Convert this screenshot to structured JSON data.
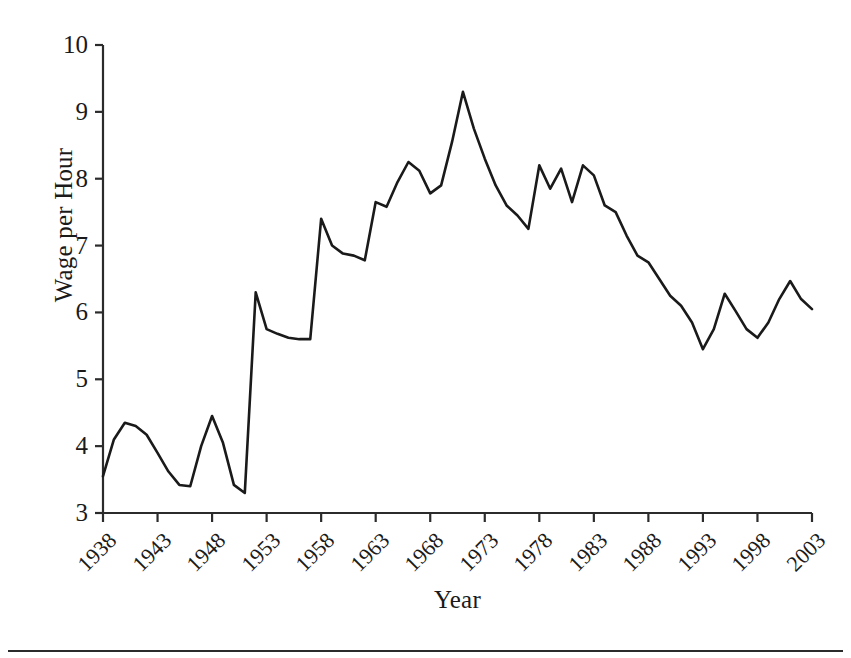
{
  "chart_data": {
    "type": "line",
    "title": "",
    "xlabel": "Year",
    "ylabel": "Wage per Hour",
    "xlim": [
      1938,
      2003
    ],
    "ylim": [
      3,
      10
    ],
    "grid": false,
    "legend": "none",
    "xticks": [
      1938,
      1943,
      1948,
      1953,
      1958,
      1963,
      1968,
      1973,
      1978,
      1983,
      1988,
      1993,
      1998,
      2003
    ],
    "xtick_labels": [
      "1938",
      "1943",
      "1948",
      "1953",
      "1958",
      "1963",
      "1968",
      "1973",
      "1978",
      "1983",
      "1988",
      "1993",
      "1998",
      "2003"
    ],
    "yticks": [
      3,
      4,
      5,
      6,
      7,
      8,
      9,
      10
    ],
    "ytick_labels": [
      "3",
      "4",
      "5",
      "6",
      "7",
      "8",
      "9",
      "10"
    ],
    "line_color": "#1a1a1a",
    "line_width": 2.6,
    "x": [
      1938,
      1939,
      1940,
      1941,
      1942,
      1943,
      1944,
      1945,
      1946,
      1947,
      1948,
      1949,
      1950,
      1951,
      1952,
      1953,
      1954,
      1955,
      1956,
      1957,
      1958,
      1959,
      1960,
      1961,
      1962,
      1963,
      1964,
      1965,
      1966,
      1967,
      1968,
      1969,
      1970,
      1971,
      1972,
      1973,
      1974,
      1975,
      1976,
      1977,
      1978,
      1979,
      1980,
      1981,
      1982,
      1983,
      1984,
      1985,
      1986,
      1987,
      1988,
      1989,
      1990,
      1991,
      1992,
      1993,
      1994,
      1995,
      1996,
      1997,
      1998,
      1999,
      2000,
      2001,
      2002,
      2003
    ],
    "values": [
      3.55,
      4.1,
      4.35,
      4.3,
      4.17,
      3.9,
      3.62,
      3.42,
      3.4,
      4.0,
      4.45,
      4.05,
      3.42,
      3.3,
      6.3,
      5.75,
      5.68,
      5.62,
      5.6,
      5.6,
      7.4,
      7.0,
      6.88,
      6.85,
      6.78,
      7.65,
      7.58,
      7.95,
      8.25,
      8.12,
      7.78,
      7.9,
      8.55,
      9.3,
      8.75,
      8.3,
      7.9,
      7.6,
      7.45,
      7.25,
      8.2,
      7.85,
      8.15,
      7.65,
      8.2,
      8.05,
      7.6,
      7.5,
      7.15,
      6.85,
      6.75,
      6.5,
      6.25,
      6.1,
      5.85,
      5.45,
      5.75,
      6.28,
      6.02,
      5.75,
      5.62,
      5.85,
      6.2,
      6.47,
      6.2,
      6.05
    ],
    "series_note": "Real wage per hour, 1938-2003"
  },
  "axes": {
    "y_title": "Wage per Hour",
    "x_title": "Year"
  }
}
